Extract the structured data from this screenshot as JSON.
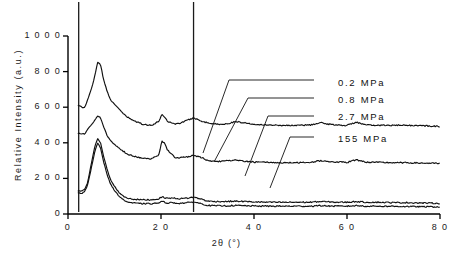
{
  "chart_data": {
    "type": "line",
    "title": "",
    "xlabel": "2θ (°)",
    "ylabel": "Relative Intensity (a.u.)",
    "xlim": [
      0,
      80
    ],
    "ylim": [
      0,
      1000
    ],
    "xticks": [
      0,
      20,
      40,
      60,
      80
    ],
    "yticks": [
      0,
      200,
      400,
      600,
      800,
      1000
    ],
    "xtick_labels": [
      "0",
      "2 0",
      "4 0",
      "6 0",
      "8 0"
    ],
    "ytick_labels": [
      "0",
      "2 0 0",
      "4 0 0",
      "6 0 0",
      "8 0 0",
      "1 0 0 0"
    ],
    "grid": false,
    "legend_position": "right-inside",
    "note": "XRD diffractograms, four curves vertically offset; sharp off-scale instrument spikes at 2theta ~2.2 and ~27",
    "series": [
      {
        "name": "0.2 MPa",
        "offset": 470,
        "color": "#111111",
        "label_x": 338,
        "label_y": 84,
        "leader": [
          [
            314,
            80
          ],
          [
            229,
            80
          ],
          [
            203,
            153
          ]
        ],
        "x": [
          2.2,
          3.0,
          3.6,
          4.2,
          5.0,
          5.8,
          6.4,
          7.0,
          7.6,
          8.4,
          9.2,
          10.0,
          11.0,
          12.0,
          13.0,
          14.5,
          16.0,
          18.0,
          19.5,
          20.2,
          20.8,
          21.4,
          22.2,
          23.0,
          24.0,
          25.0,
          26.0,
          27.0,
          28.0,
          29.0,
          30.0,
          32.0,
          34.0,
          36.0,
          38.0,
          40.0,
          43.0,
          46.0,
          49.0,
          52.0,
          54.5,
          56.0,
          58.0,
          60.0,
          62.0,
          64.0,
          67.0,
          70.0,
          73.0,
          76.0,
          80.0
        ],
        "y": [
          610,
          600,
          598,
          640,
          700,
          780,
          855,
          840,
          760,
          690,
          640,
          615,
          590,
          560,
          540,
          520,
          505,
          498,
          520,
          560,
          545,
          520,
          515,
          505,
          510,
          520,
          530,
          540,
          530,
          520,
          512,
          505,
          505,
          520,
          512,
          505,
          500,
          498,
          498,
          500,
          512,
          505,
          500,
          498,
          516,
          500,
          498,
          498,
          498,
          496,
          492
        ]
      },
      {
        "name": "0.8 MPa",
        "offset": 380,
        "color": "#111111",
        "label_x": 338,
        "label_y": 101,
        "leader": [
          [
            314,
            98
          ],
          [
            248,
            98
          ],
          [
            214,
            162
          ]
        ],
        "x": [
          2.2,
          3.0,
          3.6,
          4.2,
          5.0,
          5.8,
          6.4,
          7.0,
          7.6,
          8.4,
          9.2,
          10.0,
          11.0,
          12.0,
          13.0,
          14.5,
          16.0,
          18.0,
          19.5,
          20.2,
          20.8,
          21.4,
          22.2,
          23.0,
          24.0,
          25.0,
          26.0,
          27.0,
          28.0,
          29.0,
          30.0,
          32.0,
          34.0,
          36.0,
          38.0,
          40.0,
          43.0,
          46.0,
          49.0,
          52.0,
          54.5,
          56.0,
          58.0,
          60.0,
          62.0,
          64.0,
          67.0,
          70.0,
          73.0,
          76.0,
          80.0
        ],
        "y": [
          455,
          450,
          450,
          475,
          500,
          530,
          552,
          540,
          495,
          440,
          410,
          390,
          370,
          350,
          335,
          322,
          315,
          310,
          330,
          410,
          395,
          360,
          340,
          318,
          316,
          318,
          322,
          330,
          322,
          315,
          300,
          295,
          298,
          302,
          296,
          292,
          290,
          288,
          288,
          290,
          300,
          295,
          292,
          290,
          305,
          292,
          290,
          288,
          288,
          286,
          284
        ]
      },
      {
        "name": "2.7 MPa",
        "offset": 90,
        "color": "#111111",
        "label_x": 338,
        "label_y": 118,
        "leader": [
          [
            314,
            116
          ],
          [
            268,
            116
          ],
          [
            245,
            176
          ]
        ],
        "x": [
          2.2,
          3.0,
          3.6,
          4.2,
          5.0,
          5.8,
          6.4,
          7.0,
          7.6,
          8.4,
          9.2,
          10.0,
          11.0,
          12.0,
          13.0,
          14.5,
          16.0,
          18.0,
          19.5,
          20.2,
          20.8,
          21.4,
          22.2,
          23.0,
          24.0,
          25.0,
          26.0,
          27.0,
          28.0,
          29.0,
          30.0,
          32.0,
          34.0,
          36.0,
          38.0,
          40.0,
          43.0,
          46.0,
          49.0,
          52.0,
          54.5,
          56.0,
          58.0,
          60.0,
          62.0,
          64.0,
          67.0,
          70.0,
          73.0,
          76.0,
          80.0
        ],
        "y": [
          130,
          128,
          140,
          175,
          280,
          385,
          425,
          400,
          330,
          250,
          190,
          155,
          120,
          98,
          88,
          82,
          80,
          80,
          85,
          96,
          92,
          88,
          90,
          88,
          86,
          88,
          90,
          95,
          88,
          82,
          72,
          70,
          70,
          72,
          70,
          68,
          66,
          66,
          66,
          66,
          70,
          68,
          66,
          66,
          70,
          66,
          66,
          64,
          64,
          62,
          60
        ]
      },
      {
        "name": "155 MPa",
        "offset": 0,
        "color": "#111111",
        "label_x": 338,
        "label_y": 140,
        "leader": [
          [
            314,
            137
          ],
          [
            290,
            137
          ],
          [
            270,
            188
          ]
        ],
        "x": [
          2.2,
          3.0,
          3.6,
          4.2,
          5.0,
          5.8,
          6.4,
          7.0,
          7.6,
          8.4,
          9.2,
          10.0,
          11.0,
          12.0,
          13.0,
          14.5,
          16.0,
          18.0,
          19.5,
          20.2,
          20.8,
          21.4,
          22.2,
          23.0,
          24.0,
          25.0,
          26.0,
          27.0,
          28.0,
          29.0,
          30.0,
          32.0,
          34.0,
          36.0,
          38.0,
          40.0,
          43.0,
          46.0,
          49.0,
          52.0,
          54.5,
          56.0,
          58.0,
          60.0,
          62.0,
          64.0,
          67.0,
          70.0,
          73.0,
          76.0,
          80.0
        ],
        "y": [
          118,
          116,
          128,
          160,
          255,
          355,
          400,
          372,
          300,
          222,
          165,
          132,
          100,
          78,
          66,
          60,
          58,
          58,
          62,
          70,
          66,
          62,
          64,
          62,
          60,
          62,
          64,
          68,
          62,
          56,
          48,
          46,
          46,
          48,
          46,
          45,
          44,
          44,
          44,
          44,
          47,
          45,
          44,
          44,
          47,
          44,
          44,
          43,
          42,
          41,
          40
        ]
      }
    ],
    "spikes": [
      {
        "x": 2.3,
        "name": "instrument-spike-low-angle"
      },
      {
        "x": 27.0,
        "name": "instrument-spike-27deg"
      }
    ]
  }
}
